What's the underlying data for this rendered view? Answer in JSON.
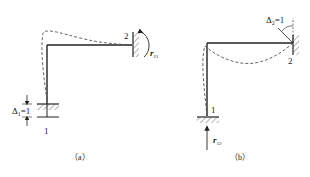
{
  "figure_a": {
    "caption": "（a）",
    "node1_label": "1",
    "node2_label": "2",
    "displacement_label": "Δ",
    "displacement_sub": "1",
    "displacement_value": "=1",
    "reaction_label": "r",
    "reaction_sub": "21"
  },
  "figure_b": {
    "caption": "（b）",
    "node1_label": "1",
    "node2_label": "2",
    "rotation_label": "Δ",
    "rotation_sub": "2",
    "rotation_value": "=1",
    "reaction_label": "r",
    "reaction_sub": "12"
  },
  "colors": {
    "frame": "#222222",
    "deflected": "#555555"
  }
}
